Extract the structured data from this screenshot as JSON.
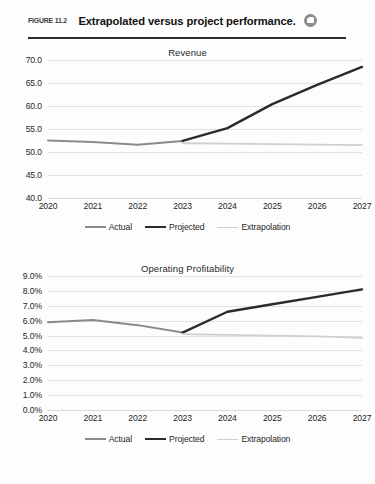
{
  "figure": {
    "label": "FIGURE 11.2",
    "title": "Extrapolated versus project performance.",
    "media_icon": "media-camera-icon"
  },
  "colors": {
    "actual": "#8a8a8a",
    "projected": "#2b2b2b",
    "extrapolation": "#cfcfcf",
    "grid": "#e2e2e2",
    "text": "#1f1f1f",
    "rule": "#2b2b2b"
  },
  "legend": {
    "items": [
      {
        "label": "Actual",
        "key": "actual"
      },
      {
        "label": "Projected",
        "key": "projected"
      },
      {
        "label": "Extrapolation",
        "key": "extrapolation"
      }
    ]
  },
  "chart_data": [
    {
      "type": "line",
      "title": "Revenue",
      "xlabel": "",
      "ylabel": "",
      "x": [
        "2020",
        "2021",
        "2022",
        "2023",
        "2024",
        "2025",
        "2026",
        "2027"
      ],
      "ylim": [
        40.0,
        70.0
      ],
      "yticks": [
        "40.0",
        "45.0",
        "50.0",
        "55.0",
        "60.0",
        "65.0",
        "70.0"
      ],
      "grid": true,
      "legend_position": "bottom",
      "series": [
        {
          "name": "Actual",
          "values": [
            52.5,
            52.2,
            51.6,
            52.4,
            null,
            null,
            null,
            null
          ]
        },
        {
          "name": "Projected",
          "values": [
            null,
            null,
            null,
            52.4,
            55.2,
            60.4,
            64.6,
            68.5
          ]
        },
        {
          "name": "Extrapolation",
          "values": [
            null,
            null,
            null,
            51.9,
            51.8,
            51.7,
            51.6,
            51.5
          ]
        }
      ]
    },
    {
      "type": "line",
      "title": "Operating Profitability",
      "xlabel": "",
      "ylabel": "",
      "x": [
        "2020",
        "2021",
        "2022",
        "2023",
        "2024",
        "2025",
        "2026",
        "2027"
      ],
      "ylim": [
        0.0,
        9.0
      ],
      "yticks": [
        "0.0%",
        "1.0%",
        "2.0%",
        "3.0%",
        "4.0%",
        "5.0%",
        "6.0%",
        "7.0%",
        "8.0%",
        "9.0%"
      ],
      "grid": true,
      "legend_position": "bottom",
      "series": [
        {
          "name": "Actual",
          "values": [
            5.9,
            6.05,
            5.7,
            5.2,
            null,
            null,
            null,
            null
          ]
        },
        {
          "name": "Projected",
          "values": [
            null,
            null,
            null,
            5.2,
            6.6,
            7.1,
            7.6,
            8.1
          ]
        },
        {
          "name": "Extrapolation",
          "values": [
            null,
            null,
            null,
            5.1,
            5.05,
            5.0,
            4.95,
            4.85
          ]
        }
      ]
    }
  ]
}
